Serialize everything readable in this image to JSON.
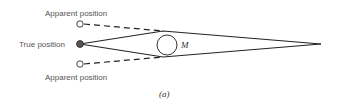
{
  "diagram": {
    "labels": {
      "apparent_top": "Apparent position",
      "true_position": "True position",
      "apparent_bottom": "Apparent position",
      "mass": "M",
      "caption": "(a)"
    },
    "colors": {
      "line": "#222222",
      "text": "#555555",
      "filled_dot": "#555555"
    }
  }
}
